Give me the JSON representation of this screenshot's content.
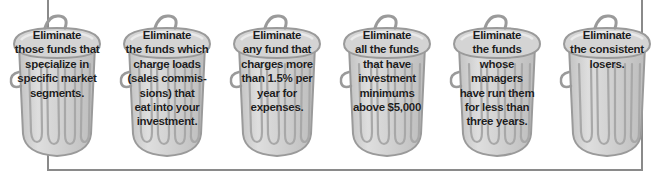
{
  "figure": {
    "type": "diagram",
    "style": "six cartoon trash cans in a row inside an open bracket frame",
    "background_color": "#ffffff",
    "frame_color": "#8a8a8a",
    "can_body_color": "#cfcfcf",
    "can_outline_color": "#9a9a9a",
    "can_highlight_color": "#e3e3e3",
    "text_color": "#1d1d1d"
  },
  "frame": {
    "left_rule_name": "left-bracket-rule",
    "right_rule_name": "right-bracket-rule",
    "bottom_rule_name": "bottom-bracket-rule"
  },
  "cans": [
    {
      "index": 1,
      "icon": "trash-can-icon",
      "text": "Eliminate\nthose funds that\nspecialize in\nspecific market\nsegments.",
      "x": 5
    },
    {
      "index": 2,
      "icon": "trash-can-icon",
      "text": "Eliminate\nthe funds which\ncharge loads\n(sales commis-\nsions) that\neat into your\ninvestment.",
      "x": 115
    },
    {
      "index": 3,
      "icon": "trash-can-icon",
      "text": "Eliminate\nany fund that\ncharges more\nthan 1.5% per\nyear for\nexpenses.",
      "x": 225
    },
    {
      "index": 4,
      "icon": "trash-can-icon",
      "text": "Eliminate\nall the funds\nthat have\ninvestment\nminimums\nabove $5,000",
      "x": 335
    },
    {
      "index": 5,
      "icon": "trash-can-icon",
      "text": "Eliminate\nthe funds\nwhose\nmanagers\nhave run them\nfor less than\nthree years.",
      "x": 445
    },
    {
      "index": 6,
      "icon": "trash-can-icon",
      "text": "Eliminate\nthe consistent\nlosers.",
      "x": 555
    }
  ]
}
